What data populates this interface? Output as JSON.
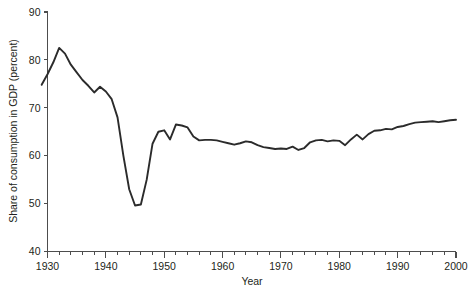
{
  "chart_data": {
    "type": "line",
    "title": "",
    "xlabel": "Year",
    "ylabel": "Share of consumption in GDP (percent)",
    "xlim": [
      1930,
      2000
    ],
    "ylim": [
      40,
      90
    ],
    "grid": false,
    "legend": null,
    "x_ticks_major": [
      1930,
      1940,
      1950,
      1960,
      1970,
      1980,
      1990,
      2000
    ],
    "x_tick_labels": [
      "1930",
      "1940",
      "1950",
      "1960",
      "1970",
      "1980",
      "1990",
      "2000"
    ],
    "x_tick_minor_step": 2,
    "y_ticks_major": [
      40,
      50,
      60,
      70,
      80,
      90
    ],
    "y_tick_labels": [
      "40",
      "50",
      "60",
      "70",
      "80",
      "90"
    ],
    "line_color": "#2b2b2b",
    "series": [
      {
        "name": "Share of consumption in GDP",
        "x": [
          1929,
          1930,
          1931,
          1932,
          1933,
          1934,
          1935,
          1936,
          1937,
          1938,
          1939,
          1940,
          1941,
          1942,
          1943,
          1944,
          1945,
          1946,
          1947,
          1948,
          1949,
          1950,
          1951,
          1952,
          1953,
          1954,
          1955,
          1956,
          1957,
          1958,
          1959,
          1960,
          1961,
          1962,
          1963,
          1964,
          1965,
          1966,
          1967,
          1968,
          1969,
          1970,
          1971,
          1972,
          1973,
          1974,
          1975,
          1976,
          1977,
          1978,
          1979,
          1980,
          1981,
          1982,
          1983,
          1984,
          1985,
          1986,
          1987,
          1988,
          1989,
          1990,
          1991,
          1992,
          1993,
          1994,
          1995,
          1996,
          1997,
          1998,
          1999,
          2000
        ],
        "values": [
          74.8,
          77.0,
          79.5,
          82.5,
          81.3,
          79.0,
          77.4,
          75.8,
          74.6,
          73.2,
          74.4,
          73.4,
          71.8,
          68.0,
          60.0,
          53.0,
          49.6,
          49.8,
          55.0,
          62.5,
          65.0,
          65.3,
          63.4,
          66.5,
          66.3,
          65.9,
          64.0,
          63.2,
          63.3,
          63.3,
          63.2,
          62.9,
          62.6,
          62.3,
          62.6,
          63.0,
          62.8,
          62.2,
          61.8,
          61.6,
          61.4,
          61.5,
          61.4,
          61.9,
          61.2,
          61.6,
          62.8,
          63.2,
          63.3,
          63.0,
          63.2,
          63.1,
          62.2,
          63.4,
          64.4,
          63.4,
          64.5,
          65.2,
          65.3,
          65.6,
          65.5,
          66.0,
          66.2,
          66.6,
          66.9,
          67.0,
          67.1,
          67.2,
          67.0,
          67.2,
          67.4,
          67.5
        ]
      }
    ]
  },
  "figure": {
    "xlabel": "Year",
    "ylabel": "Share of consumption in GDP (percent)"
  }
}
